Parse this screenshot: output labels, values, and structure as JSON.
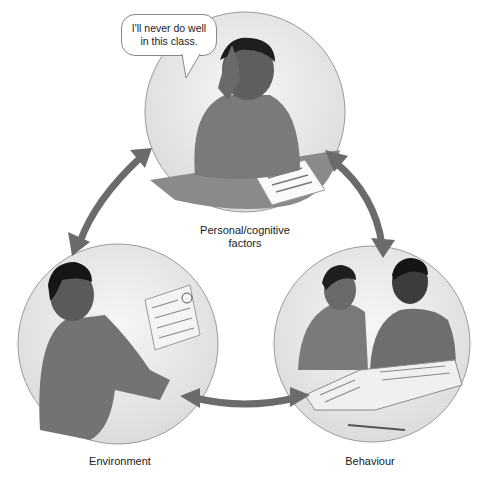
{
  "diagram": {
    "nodes": [
      {
        "id": "personal",
        "label": "Personal/cognitive factors",
        "label_line1": "Personal/cognitive",
        "label_line2": "factors",
        "illustration": "student-frustrated-at-desk"
      },
      {
        "id": "environment",
        "label": "Environment",
        "illustration": "woman-reading-graded-paper"
      },
      {
        "id": "behaviour",
        "label": "Behaviour",
        "illustration": "two-students-studying-book"
      }
    ],
    "edges": [
      {
        "from": "personal",
        "to": "environment",
        "type": "bidirectional"
      },
      {
        "from": "personal",
        "to": "behaviour",
        "type": "bidirectional"
      },
      {
        "from": "environment",
        "to": "behaviour",
        "type": "bidirectional"
      }
    ],
    "speech_bubble": {
      "line1": "I'll never do well",
      "line2": "in this class."
    },
    "colors": {
      "arrow": "#6b6b6b",
      "circle_fill": "#ececec",
      "circle_border": "#9a9a9a"
    }
  }
}
